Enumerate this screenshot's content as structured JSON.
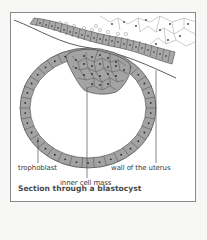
{
  "figure": {
    "caption": "Section through a blastocyst",
    "labels": {
      "trophoblast": "trophoblast",
      "inner_cell_mass": "inner cell mass",
      "uterus_wall": "wall of the uterus"
    }
  },
  "colors": {
    "cell_fill": "#a3a3a3",
    "cell_stroke": "#4a4a4a",
    "nucleus": "#2a2a2a",
    "line": "#555555",
    "frame": "#8a8a8a",
    "background": "#ffffff"
  }
}
